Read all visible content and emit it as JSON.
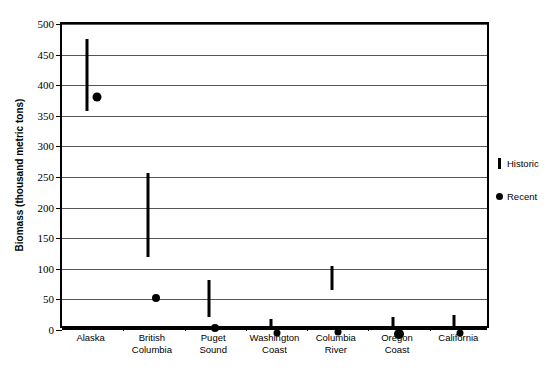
{
  "chart_data": {
    "type": "scatter",
    "title": "",
    "xlabel": "",
    "ylabel": "Biomass (thousand metric tons)",
    "ylim": [
      0,
      500
    ],
    "ytick_step": 50,
    "yticks": [
      0,
      50,
      100,
      150,
      200,
      250,
      300,
      350,
      400,
      450,
      500
    ],
    "ytick_labels": [
      "0",
      "50",
      "100",
      "150",
      "200",
      "250",
      "300",
      "350",
      "400",
      "450",
      "500"
    ],
    "grid": true,
    "legend_position": "right",
    "categories": [
      "Alaska",
      "British Columbia",
      "Puget Sound",
      "Washington Coast",
      "Columbia River",
      "Oregon Coast",
      "California"
    ],
    "category_lines": [
      [
        "Alaska"
      ],
      [
        "British",
        "Columbia"
      ],
      [
        "Puget",
        "Sound"
      ],
      [
        "Washington",
        "Coast"
      ],
      [
        "Columbia",
        "River"
      ],
      [
        "Oregon",
        "Coast"
      ],
      [
        "California"
      ]
    ],
    "series": [
      {
        "name": "Historic",
        "marker": "vertical-bar",
        "type": "range",
        "low": [
          358,
          119,
          21,
          0,
          65,
          0,
          3
        ],
        "high": [
          475,
          257,
          81,
          18,
          104,
          22,
          24
        ]
      },
      {
        "name": "Recent",
        "marker": "filled-circle",
        "type": "point",
        "values": [
          388,
          59,
          9,
          1,
          2,
          2,
          1
        ],
        "marker_sizes": [
          9,
          8,
          8,
          7,
          7,
          10,
          7
        ]
      }
    ],
    "legend": [
      {
        "label": "Historic",
        "marker": "vertical-bar"
      },
      {
        "label": "Recent",
        "marker": "filled-circle"
      }
    ],
    "colors": {
      "series": "#000000",
      "gridline": "#555555",
      "axis": "#000000",
      "background": "#ffffff"
    }
  }
}
